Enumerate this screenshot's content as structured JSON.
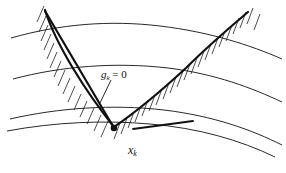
{
  "figure": {
    "title": "",
    "background_color": "#ffffff",
    "stroke_color": "#111111",
    "labels": {
      "constraint": {
        "symbol": "g",
        "subscript": "k",
        "relation": "= 0",
        "full": "g_k = 0"
      },
      "point": {
        "symbol": "x",
        "subscript": "k",
        "full": "x_k"
      }
    },
    "icons": {
      "marker": "filled-dot-marker",
      "leader": "leader-line"
    },
    "geometry": {
      "contours": [
        {
          "name": "contour-1",
          "path": "M 11,38 C 60,24 110,20 160,26 C 210,32 250,45 282,59"
        },
        {
          "name": "contour-2",
          "path": "M 13,79 C 62,66 116,62 168,68 C 216,74 252,88 282,102"
        },
        {
          "name": "contour-3",
          "path": "M 10,119 C 58,108 112,104 164,110 C 214,116 252,130 282,145"
        },
        {
          "name": "contour-4",
          "path": "M 7,131 C 56,122 104,120 150,124 C 198,128 240,140 275,157"
        }
      ],
      "constraint_curve": {
        "name": "constraint-boundary",
        "path": "M 45,10 C 56,45 86,92 114,127 C 136,112 160,92 186,68 C 210,44 234,24 248,12"
      },
      "tangent_line": {
        "name": "tangent-line",
        "path": "M 45,11 L 114,127"
      },
      "secondary_segment": {
        "name": "secondary-line",
        "path": "M 133,129 L 193,121"
      },
      "point_marker": {
        "name": "point-xk",
        "cx": 114,
        "cy": 128,
        "r": 3.2
      },
      "leader_line": {
        "name": "label-leader",
        "path": "M 110,80 L 100,102"
      },
      "hatching": {
        "name": "infeasible-hatching",
        "angle_deg": 75,
        "spacing_px": 6,
        "length_px": 16
      }
    }
  }
}
